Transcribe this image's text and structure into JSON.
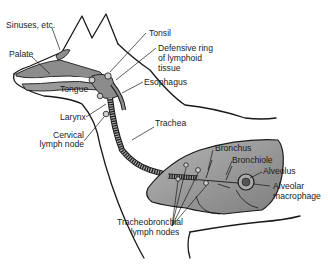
{
  "diagram": {
    "colors": {
      "outline": "#1a1a1a",
      "tissue_fill": "#8c8c8c",
      "lung_fill": "#9a9a9a",
      "lung_light": "#b8b8b8",
      "background": "#ffffff"
    },
    "labels": {
      "sinuses": "Sinuses, etc.",
      "palate": "Palate",
      "tongue": "Tongue",
      "larynx": "Larynx",
      "cervical_line1": "Cervical",
      "cervical_line2": "lymph node",
      "tonsil": "Tonsil",
      "ring_line1": "Defensive ring",
      "ring_line2": "of lymphoid",
      "ring_line3": "tissue",
      "esophagus": "Esophagus",
      "trachea": "Trachea",
      "bronchus": "Bronchus",
      "bronchiole": "Bronchiole",
      "alveolus": "Alveolus",
      "macrophage_line1": "Alveolar",
      "macrophage_line2": "macrophage",
      "tb_line1": "Tracheobronchial",
      "tb_line2": "lymph nodes"
    }
  }
}
